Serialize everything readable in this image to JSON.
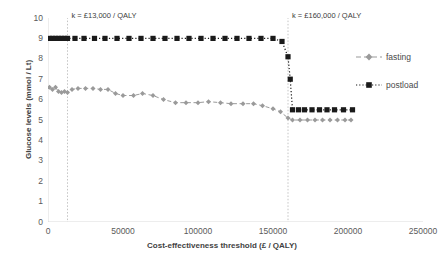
{
  "chart_data": {
    "type": "line",
    "title": "",
    "xlabel": "Cost-effectiveness threshold (£ / QALY)",
    "ylabel": "Glucose levels (mmol / Lt)",
    "xlim": [
      0,
      250000
    ],
    "ylim": [
      0,
      10
    ],
    "xticks": [
      0,
      50000,
      100000,
      150000,
      200000,
      250000
    ],
    "xticklabels": [
      "0",
      "50000",
      "100000",
      "150000",
      "200000",
      "250000"
    ],
    "yticks": [
      0,
      1,
      2,
      3,
      4,
      5,
      6,
      7,
      8,
      9,
      10
    ],
    "yticklabels": [
      "0",
      "1",
      "2",
      "3",
      "4",
      "5",
      "6",
      "7",
      "8",
      "9",
      "10"
    ],
    "grid": false,
    "legend_position": "right",
    "series": [
      {
        "name": "fasting",
        "marker": "diamond",
        "color": "#9a9a9a",
        "linestyle": "dashed",
        "x": [
          1000,
          3000,
          5000,
          7000,
          9000,
          11000,
          13000,
          16000,
          20000,
          25000,
          30000,
          35000,
          40000,
          45000,
          50000,
          57000,
          63000,
          70000,
          77000,
          85000,
          92000,
          100000,
          107000,
          115000,
          122000,
          130000,
          137000,
          143000,
          150000,
          155000,
          160000,
          163000,
          168000,
          173000,
          178000,
          183000,
          188000,
          193000,
          198000,
          202000
        ],
        "y": [
          6.6,
          6.5,
          6.6,
          6.4,
          6.35,
          6.4,
          6.35,
          6.5,
          6.55,
          6.55,
          6.55,
          6.5,
          6.5,
          6.3,
          6.2,
          6.2,
          6.3,
          6.2,
          6.0,
          5.85,
          5.85,
          5.85,
          5.9,
          5.85,
          5.8,
          5.8,
          5.8,
          5.7,
          5.55,
          5.4,
          5.1,
          5.0,
          5.0,
          5.0,
          5.0,
          5.0,
          5.0,
          5.0,
          5.0,
          5.0
        ]
      },
      {
        "name": "postload",
        "marker": "square",
        "color": "#1a1a1a",
        "linestyle": "dotted",
        "x": [
          1000,
          3000,
          5000,
          7000,
          9000,
          11000,
          13000,
          18000,
          24000,
          31000,
          38000,
          46000,
          54000,
          62000,
          70000,
          78000,
          86000,
          94000,
          102000,
          110000,
          118000,
          126000,
          134000,
          142000,
          150000,
          156000,
          160000,
          161500,
          163000,
          167000,
          171000,
          176000,
          181000,
          186000,
          191000,
          197000,
          203000
        ],
        "y": [
          9.0,
          9.0,
          9.0,
          9.0,
          9.0,
          9.0,
          9.0,
          9.0,
          9.0,
          9.0,
          9.0,
          9.0,
          9.0,
          9.0,
          9.0,
          9.0,
          9.0,
          9.0,
          9.0,
          9.0,
          9.0,
          9.0,
          9.0,
          9.0,
          9.0,
          8.85,
          8.1,
          7.0,
          5.5,
          5.5,
          5.5,
          5.5,
          5.5,
          5.5,
          5.5,
          5.5,
          5.5
        ]
      }
    ],
    "annotations": [
      {
        "text": "k = £13,000 / QALY",
        "x": 13000,
        "y": 10.0
      },
      {
        "text": "k = £160,000 / QALY",
        "x": 160000,
        "y": 10.0
      }
    ],
    "vlines": [
      {
        "x": 13000,
        "style": "dotted",
        "color": "#bdbdbd"
      },
      {
        "x": 160000,
        "style": "dotted",
        "color": "#bdbdbd"
      }
    ]
  },
  "legend": {
    "items": [
      {
        "label": "fasting"
      },
      {
        "label": "postload"
      }
    ]
  }
}
